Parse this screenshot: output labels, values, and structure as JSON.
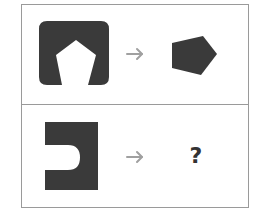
{
  "puzzle": {
    "rows": [
      {
        "source_shape": "rounded-square-with-pentagon-cutout",
        "arrow": "→",
        "result_shape": "pentagon"
      },
      {
        "source_shape": "rectangle-with-u-notch",
        "arrow": "→",
        "result": "?"
      }
    ]
  },
  "colors": {
    "shape_fill": "#3a3a3a",
    "arrow": "#a0a0a0",
    "border": "#9a9a9a",
    "question_mark": "#333333"
  }
}
